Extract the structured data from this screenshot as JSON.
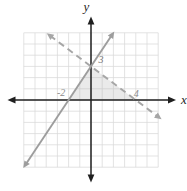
{
  "figure": {
    "axis_labels": {
      "x": "x",
      "y": "y"
    }
  },
  "chart_data": {
    "type": "line",
    "title": "",
    "xlabel": "x",
    "ylabel": "y",
    "xlim": [
      -6,
      6
    ],
    "ylim": [
      -6,
      6
    ],
    "grid": true,
    "series": [
      {
        "name": "solid line",
        "style": "solid",
        "color": "#9d9d9d",
        "equation": "y = (3/2)x + 3",
        "slope": 1.5,
        "y_intercept": 3,
        "x_intercept": -2,
        "points": [
          [
            -2,
            0
          ],
          [
            0,
            3
          ]
        ],
        "draw_range_x": [
          -6.05,
          2.08
        ]
      },
      {
        "name": "dashed line",
        "style": "dashed",
        "color": "#a6a6a6",
        "equation": "y = -(3/4)x + 3",
        "slope": -0.75,
        "y_intercept": 3,
        "x_intercept": 4,
        "points": [
          [
            0,
            3
          ],
          [
            4,
            0
          ]
        ],
        "draw_range_x": [
          -3.95,
          6.3
        ]
      }
    ],
    "intersection": [
      0,
      3
    ],
    "shaded_region": {
      "vertices": [
        [
          -2,
          0
        ],
        [
          0,
          3
        ],
        [
          4,
          0
        ]
      ],
      "color": "#b4b4b4",
      "opacity": 0.28
    },
    "tick_annotations": [
      {
        "text": "-2",
        "at": [
          -2,
          0
        ],
        "offset_px": [
          -7.5,
          -4.5
        ],
        "color": "#8c8c8c"
      },
      {
        "text": "3",
        "at": [
          0,
          3
        ],
        "offset_px": [
          10,
          -3
        ],
        "color": "#777777"
      },
      {
        "text": "4",
        "at": [
          4,
          0
        ],
        "offset_px": [
          0.5,
          -3.5
        ],
        "color": "#8c8c8c"
      }
    ],
    "colors": {
      "grid": "#d9d9d9",
      "axis": "#1f1f1f",
      "background": "#ffffff"
    }
  }
}
